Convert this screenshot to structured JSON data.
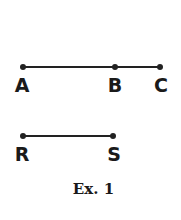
{
  "figure": {
    "lines": [
      {
        "id": "ABC",
        "points": [
          "A",
          "B",
          "C"
        ]
      },
      {
        "id": "RS",
        "points": [
          "R",
          "S"
        ]
      }
    ],
    "points": {
      "A": {
        "label": "A"
      },
      "B": {
        "label": "B"
      },
      "C": {
        "label": "C"
      },
      "R": {
        "label": "R"
      },
      "S": {
        "label": "S"
      }
    },
    "caption": "Ex. 1"
  }
}
